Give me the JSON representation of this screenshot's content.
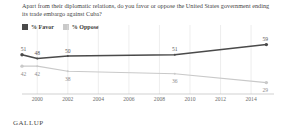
{
  "title": "Apart from their diplomatic relations, do you favor or oppose the United States government ending its trade embargo against Cuba?",
  "footer": "GALLUP",
  "colors": {
    "favor": "#4a4a4a",
    "oppose": "#c9c9c9",
    "grid": "#e2e2e2",
    "axis": "#bdbdbd",
    "text": "#3f3f3f"
  },
  "legend": {
    "items": [
      {
        "label": "% Favor",
        "color": "#4a4a4a"
      },
      {
        "label": "% Oppose",
        "color": "#c9c9c9"
      }
    ]
  },
  "chart_data": {
    "type": "line",
    "title": "Apart from their diplomatic relations, do you favor or oppose the United States government ending its trade embargo against Cuba?",
    "xlabel": "",
    "ylabel": "",
    "x": [
      1999,
      2000,
      2002,
      2004,
      2006,
      2008,
      2009,
      2010,
      2012,
      2014,
      2015
    ],
    "xticks": [
      "2000",
      "2002",
      "2004",
      "2006",
      "2008",
      "2010",
      "2012",
      "2014"
    ],
    "xlim": [
      1999,
      2015.5
    ],
    "ylim": [
      20,
      65
    ],
    "grid": true,
    "legend_position": "top-left",
    "series": [
      {
        "name": "% Favor",
        "color": "#4a4a4a",
        "points": [
          {
            "x": 1999,
            "y": 51,
            "label": "51"
          },
          {
            "x": 2000,
            "y": 48,
            "label": "48"
          },
          {
            "x": 2002,
            "y": 50,
            "label": "50"
          },
          {
            "x": 2009,
            "y": 51,
            "label": "51"
          },
          {
            "x": 2015,
            "y": 59,
            "label": "59"
          }
        ]
      },
      {
        "name": "% Oppose",
        "color": "#c9c9c9",
        "points": [
          {
            "x": 1999,
            "y": 42,
            "label": "42"
          },
          {
            "x": 2000,
            "y": 42,
            "label": "42"
          },
          {
            "x": 2002,
            "y": 38,
            "label": "38"
          },
          {
            "x": 2009,
            "y": 36,
            "label": "36"
          },
          {
            "x": 2015,
            "y": 29,
            "label": "29"
          }
        ]
      }
    ]
  }
}
